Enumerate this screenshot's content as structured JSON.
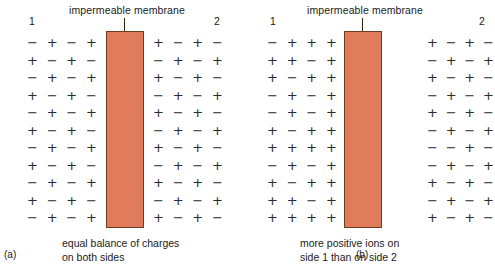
{
  "figure": {
    "membrane_color": "#E07C5B",
    "membrane_border_color": "#6B3B22",
    "charge_color": "#2B2B2B"
  },
  "panels": [
    {
      "tag": "(a)",
      "membrane_label": "impermeable membrane",
      "side_1": "1",
      "side_2": "2",
      "caption": "equal balance of charges\non both sides",
      "left_grid": [
        [
          "−",
          "+",
          "−",
          "+"
        ],
        [
          "+",
          "−",
          "+",
          "−"
        ],
        [
          "−",
          "+",
          "−",
          "+"
        ],
        [
          "+",
          "−",
          "+",
          "−"
        ],
        [
          "−",
          "+",
          "−",
          "+"
        ],
        [
          "+",
          "−",
          "+",
          "−"
        ],
        [
          "−",
          "+",
          "−",
          "+"
        ],
        [
          "+",
          "−",
          "+",
          "−"
        ],
        [
          "−",
          "+",
          "−",
          "+"
        ],
        [
          "+",
          "−",
          "+",
          "−"
        ],
        [
          "−",
          "+",
          "−",
          "+"
        ]
      ],
      "right_grid": [
        [
          "+",
          "−",
          "+",
          "−"
        ],
        [
          "−",
          "+",
          "−",
          "+"
        ],
        [
          "+",
          "−",
          "+",
          "−"
        ],
        [
          "−",
          "+",
          "−",
          "+"
        ],
        [
          "+",
          "−",
          "+",
          "−"
        ],
        [
          "−",
          "+",
          "−",
          "+"
        ],
        [
          "+",
          "−",
          "+",
          "−"
        ],
        [
          "−",
          "+",
          "−",
          "+"
        ],
        [
          "+",
          "−",
          "+",
          "−"
        ],
        [
          "−",
          "+",
          "−",
          "+"
        ],
        [
          "+",
          "−",
          "+",
          "−"
        ]
      ]
    },
    {
      "tag": "(b)",
      "membrane_label": "impermeable membrane",
      "side_1": "1",
      "side_2": "2",
      "caption": "more positive ions on\nside 1 than on side 2",
      "left_grid": [
        [
          "−",
          "+",
          "+",
          "+"
        ],
        [
          "+",
          "+",
          "−",
          "+"
        ],
        [
          "+",
          "−",
          "+",
          "+"
        ],
        [
          "−",
          "+",
          "−",
          "+"
        ],
        [
          "−",
          "+",
          "−",
          "+"
        ],
        [
          "+",
          "−",
          "+",
          "+"
        ],
        [
          "+",
          "+",
          "+",
          "+"
        ],
        [
          "−",
          "+",
          "−",
          "+"
        ],
        [
          "+",
          "−",
          "+",
          "+"
        ],
        [
          "+",
          "+",
          "−",
          "+"
        ],
        [
          "+",
          "+",
          "+",
          "+"
        ]
      ],
      "right_grid": [
        [
          "+",
          "−",
          "+",
          "−"
        ],
        [
          "−",
          "+",
          "−",
          "+"
        ],
        [
          "+",
          "−",
          "+",
          "−"
        ],
        [
          "−",
          "+",
          "−",
          "+"
        ],
        [
          "+",
          "−",
          "+",
          "−"
        ],
        [
          "−",
          "+",
          "−",
          "+"
        ],
        [
          "−",
          "−",
          "+",
          "−"
        ],
        [
          "−",
          "+",
          "−",
          "+"
        ],
        [
          "+",
          "−",
          "+",
          "−"
        ],
        [
          "−",
          "+",
          "−",
          "+"
        ],
        [
          "+",
          "−",
          "+",
          "−"
        ]
      ]
    }
  ]
}
